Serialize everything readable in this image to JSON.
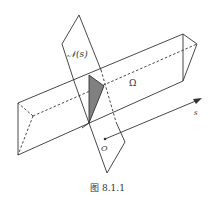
{
  "figure": {
    "caption": "图 8.1.1",
    "labels": {
      "plane": "𝒩(s)",
      "region": "Ω",
      "axis": "s",
      "origin": "O"
    },
    "colors": {
      "line": "#333333",
      "shaded_section": "#808080",
      "background": "#ffffff"
    },
    "elements": [
      "normal plane N(s) parallelogram",
      "triangular prism (region Ω)",
      "shaded cross-section triangle",
      "s-axis arrow from origin O"
    ]
  }
}
